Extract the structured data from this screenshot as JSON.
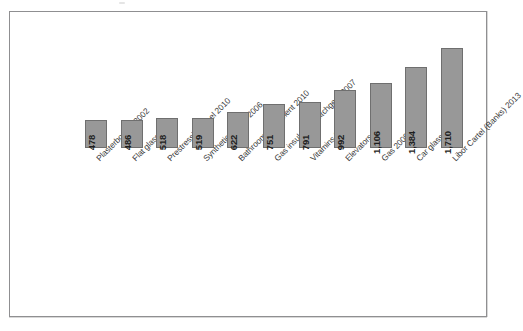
{
  "chart_data": {
    "type": "bar",
    "title": "",
    "subtitle": "",
    "xlabel": "",
    "ylabel": "",
    "ylim": [
      0,
      1710
    ],
    "grid": false,
    "legend": "none",
    "orientation": "vertical",
    "bar_color": "#989898",
    "bar_border_color": "#6f6f6f",
    "frame_color": "#8f8f91",
    "value_label_position": "inside-bottom",
    "value_label_rotation": -90,
    "category_label_rotation": -45,
    "categories": [
      "Plasterboards 2002",
      "Flat glass 2007",
      "Prestressing steel 2010",
      "Synthetic rubber 2006",
      "Bathroom equipment 2010",
      "Gas insulated switchgear 2007",
      "Vitamins 2001",
      "Elevators 2007",
      "Gas 2009",
      "Car glass 2008",
      "Libor Cartel (Banks) 2013"
    ],
    "values": [
      478,
      486,
      518,
      519,
      622,
      751,
      791,
      992,
      1106,
      1384,
      1710
    ],
    "value_labels": [
      "478",
      "486",
      "518",
      "519",
      "622",
      "751",
      "791",
      "992",
      "1,106",
      "1,384",
      "1,710"
    ],
    "bars": [
      {
        "category": "Plasterboards 2002",
        "value": 478,
        "label": "478"
      },
      {
        "category": "Flat glass 2007",
        "value": 486,
        "label": "486"
      },
      {
        "category": "Prestressing steel 2010",
        "value": 518,
        "label": "518"
      },
      {
        "category": "Synthetic rubber 2006",
        "value": 519,
        "label": "519"
      },
      {
        "category": "Bathroom equipment 2010",
        "value": 622,
        "label": "622"
      },
      {
        "category": "Gas insulated switchgear 2007",
        "value": 751,
        "label": "751"
      },
      {
        "category": "Vitamins 2001",
        "value": 791,
        "label": "791"
      },
      {
        "category": "Elevators 2007",
        "value": 992,
        "label": "992"
      },
      {
        "category": "Gas 2009",
        "value": 1106,
        "label": "1,106"
      },
      {
        "category": "Car glass 2008",
        "value": 1384,
        "label": "1,384"
      },
      {
        "category": "Libor Cartel (Banks) 2013",
        "value": 1710,
        "label": "1,710"
      }
    ]
  }
}
